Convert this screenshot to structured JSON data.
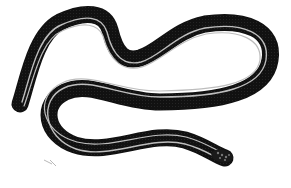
{
  "image": {
    "subject": "striped snake engraving",
    "style": "black and white illustration",
    "colors": {
      "background": "#ffffff",
      "body": "#111111",
      "stripe": "#b8b8b8",
      "belly_edge": "#e6e6e6"
    }
  }
}
